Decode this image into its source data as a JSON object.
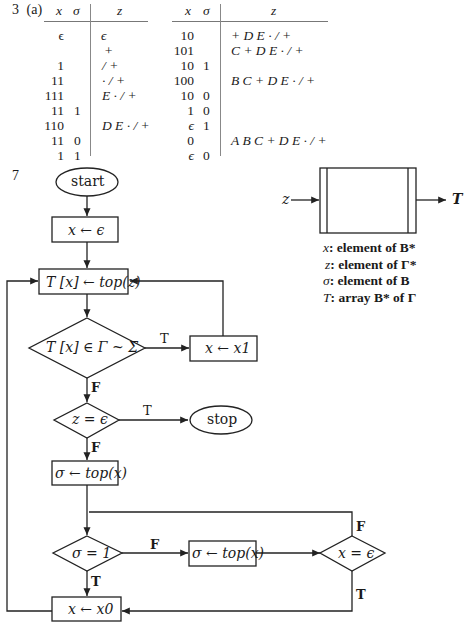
{
  "problem": {
    "label": "3",
    "part": "(a)"
  },
  "table": {
    "headers": {
      "x": "x",
      "sigma": "σ",
      "z": "z"
    },
    "left": [
      {
        "x": "ϵ",
        "sigma": "",
        "z": "ϵ"
      },
      {
        "x": "",
        "sigma": "",
        "z": "+"
      },
      {
        "x": "1",
        "sigma": "",
        "z": "/ +"
      },
      {
        "x": "11",
        "sigma": "",
        "z": "· / +"
      },
      {
        "x": "111",
        "sigma": "",
        "z": "E · / +"
      },
      {
        "x": "11",
        "sigma": "1",
        "z": ""
      },
      {
        "x": "110",
        "sigma": "",
        "z": "D E · / +"
      },
      {
        "x": "11",
        "sigma": "0",
        "z": ""
      },
      {
        "x": "1",
        "sigma": "1",
        "z": ""
      }
    ],
    "right": [
      {
        "x": "10",
        "sigma": "",
        "z": "+ D E · / +"
      },
      {
        "x": "101",
        "sigma": "",
        "z": "C + D E · / +"
      },
      {
        "x": "10",
        "sigma": "1",
        "z": ""
      },
      {
        "x": "100",
        "sigma": "",
        "z": "B C + D E · / +"
      },
      {
        "x": "10",
        "sigma": "0",
        "z": ""
      },
      {
        "x": "1",
        "sigma": "0",
        "z": ""
      },
      {
        "x": "ϵ",
        "sigma": "1",
        "z": ""
      },
      {
        "x": "0",
        "sigma": "",
        "z": "A B C + D E · / +"
      },
      {
        "x": "ϵ",
        "sigma": "0",
        "z": ""
      }
    ]
  },
  "problem7": {
    "label": "7"
  },
  "flowchart": {
    "start": "start",
    "init": "x ← ϵ",
    "assign_T": "T [x] ← top(z)",
    "test_T": "T [x] ∈ Γ ~ Σ",
    "append_1": "x ← x1",
    "test_z": "z = ϵ",
    "stop": "stop",
    "pop_sigma_1": "σ ← top(x)",
    "test_sigma": "σ = 1",
    "pop_sigma_2": "σ ← top(x)",
    "test_x": "x = ϵ",
    "append_0": "x ← x0",
    "label_true": "T",
    "label_false": "F"
  },
  "block": {
    "input": "z",
    "output": "T"
  },
  "legend": [
    {
      "var": "x",
      "text": ": element of B*"
    },
    {
      "var": "z",
      "text": ": element of Γ*"
    },
    {
      "var": "σ",
      "text": ": element of B"
    },
    {
      "var": "T",
      "text": ": array B* of Γ"
    }
  ]
}
